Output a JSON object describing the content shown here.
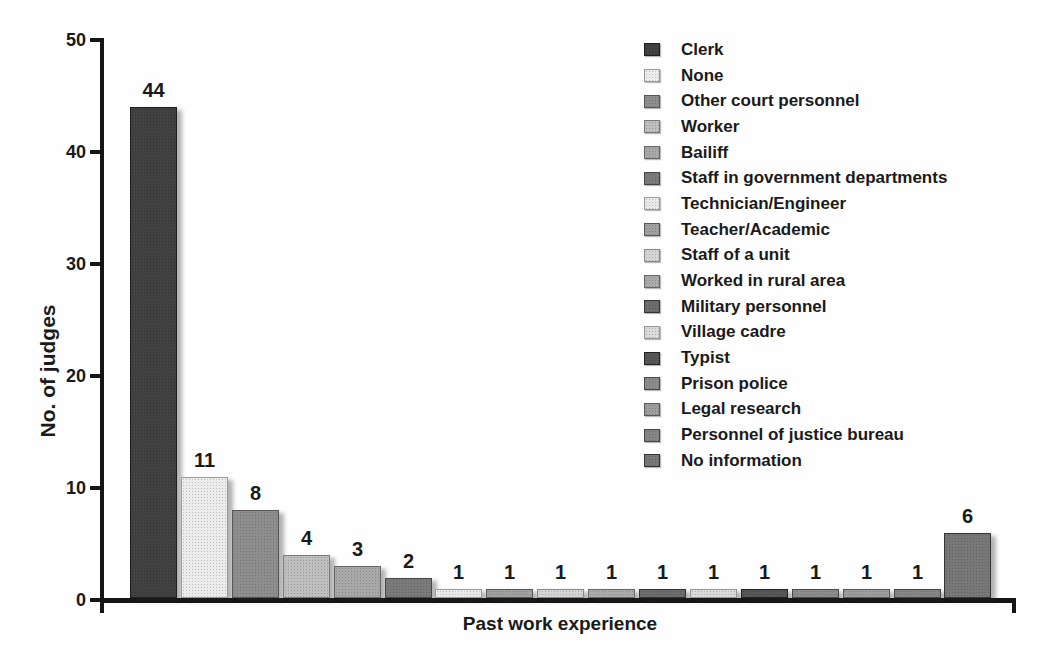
{
  "chart_data": {
    "type": "bar",
    "title": "",
    "xlabel": "Past work experience",
    "ylabel": "No. of judges",
    "ylim": [
      0,
      50
    ],
    "yticks": [
      0,
      10,
      20,
      30,
      40,
      50
    ],
    "grid": false,
    "legend_position": "upper right",
    "categories": [
      "Clerk",
      "None",
      "Other court personnel",
      "Worker",
      "Bailiff",
      "Staff in government departments",
      "Technician/Engineer",
      "Teacher/Academic",
      "Staff of a unit",
      "Worked in rural area",
      "Military personnel",
      "Village cadre",
      "Typist",
      "Prison police",
      "Legal research",
      "Personnel of justice bureau",
      "No information"
    ],
    "values": [
      44,
      11,
      8,
      4,
      3,
      2,
      1,
      1,
      1,
      1,
      1,
      1,
      1,
      1,
      1,
      1,
      6
    ],
    "bar_fill_colors": [
      "#414141",
      "#ececec",
      "#8e8e8e",
      "#bfbfbf",
      "#a8a8a8",
      "#7b7b7b",
      "#e9e9e9",
      "#a0a0a0",
      "#d5d5d5",
      "#ababab",
      "#6d6d6d",
      "#dadada",
      "#575757",
      "#8c8c8c",
      "#9d9d9d",
      "#868686",
      "#787878"
    ],
    "bar_border_colors": [
      "#1f1f1f",
      "#999999",
      "#555555",
      "#7a7a7a",
      "#666666",
      "#444444",
      "#9a9a9a",
      "#565656",
      "#888888",
      "#676767",
      "#333333",
      "#979797",
      "#222222",
      "#484848",
      "#575757",
      "#454545",
      "#343434"
    ],
    "axis_color": "#151515",
    "text_color": "#1a1a1a"
  }
}
